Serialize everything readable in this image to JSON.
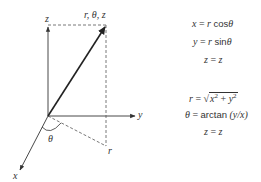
{
  "diagram": {
    "type": "cylindrical-coordinates",
    "axes": {
      "z_label": "z",
      "y_label": "y",
      "x_label": "x"
    },
    "point_label": "r, θ, z",
    "projection_label": "r",
    "angle_label": "θ",
    "colors": {
      "line": "#333333",
      "dashed": "#555555",
      "text": "#333333"
    }
  },
  "equations": {
    "to_cartesian": [
      {
        "lhs": "x",
        "rhs_var": "r",
        "rhs_fn": "cos",
        "rhs_arg": "θ"
      },
      {
        "lhs": "y",
        "rhs_var": "r",
        "rhs_fn": "sin",
        "rhs_arg": "θ"
      },
      {
        "lhs": "z",
        "rhs": "z"
      }
    ],
    "to_cylindrical": [
      {
        "lhs": "r",
        "rhs": "√(x² + y²)"
      },
      {
        "lhs": "θ",
        "rhs_fn": "arctan",
        "rhs_arg": "(y/x)"
      },
      {
        "lhs": "z",
        "rhs": "z"
      }
    ],
    "eq_sign": "="
  }
}
